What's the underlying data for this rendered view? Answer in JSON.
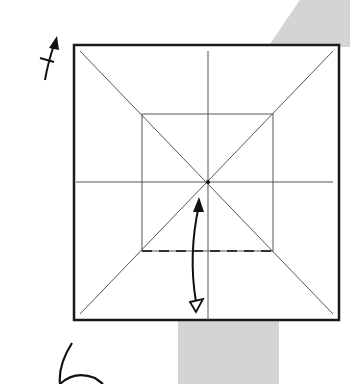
{
  "diagram": {
    "step_number": "6",
    "colors": {
      "background": "#ffffff",
      "band": "#d4d4d4",
      "outline": "#1a1a1a",
      "crease": "#555555",
      "arrow": "#111111"
    },
    "square": {
      "x": 74,
      "y": 45,
      "size": 275
    },
    "inner_square": {
      "x": 142,
      "y": 114,
      "w": 131,
      "h": 137
    },
    "center": {
      "x": 208,
      "y": 182
    },
    "fold_line": {
      "type": "valley-fold-dashed",
      "y": 251,
      "x1": 142,
      "x2": 273
    },
    "arrows": [
      {
        "name": "fold-and-unfold-arrow",
        "from": [
          196,
          305
        ],
        "to": [
          199,
          197
        ]
      },
      {
        "name": "turn-over-arrow",
        "near": [
          52,
          45
        ]
      }
    ]
  }
}
